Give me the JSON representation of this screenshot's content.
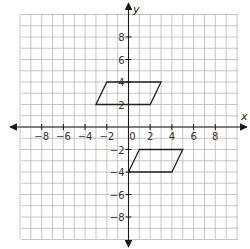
{
  "graph": {
    "axes": {
      "x_label": "x",
      "y_label": "y",
      "x_range": [
        -10,
        10
      ],
      "y_range": [
        -10,
        10
      ],
      "grid_step": 1,
      "x_tick_labels": [
        {
          "value": -8,
          "label": "−8"
        },
        {
          "value": -6,
          "label": "−6"
        },
        {
          "value": -4,
          "label": "−4"
        },
        {
          "value": -2,
          "label": "−2"
        },
        {
          "value": 0,
          "label": "0"
        },
        {
          "value": 2,
          "label": "2"
        },
        {
          "value": 4,
          "label": "4"
        },
        {
          "value": 6,
          "label": "6"
        },
        {
          "value": 8,
          "label": "8"
        }
      ],
      "y_tick_labels": [
        {
          "value": 8,
          "label": "8"
        },
        {
          "value": 6,
          "label": "6"
        },
        {
          "value": 4,
          "label": "4"
        },
        {
          "value": 2,
          "label": "2"
        },
        {
          "value": -2,
          "label": "−2"
        },
        {
          "value": -4,
          "label": "−4"
        },
        {
          "value": -6,
          "label": "−6"
        },
        {
          "value": -8,
          "label": "−8"
        }
      ]
    },
    "shapes": [
      {
        "name": "parallelogram-upper",
        "vertices": [
          [
            -3,
            2
          ],
          [
            -2,
            4
          ],
          [
            3,
            4
          ],
          [
            2,
            2
          ]
        ]
      },
      {
        "name": "parallelogram-lower",
        "vertices": [
          [
            0,
            -4
          ],
          [
            1,
            -2
          ],
          [
            5,
            -2
          ],
          [
            4,
            -4
          ]
        ]
      }
    ],
    "colors": {
      "grid": "#b8b8b8",
      "axis": "#1a1a1a",
      "shape_stroke": "#222222",
      "background": "#ffffff"
    }
  }
}
